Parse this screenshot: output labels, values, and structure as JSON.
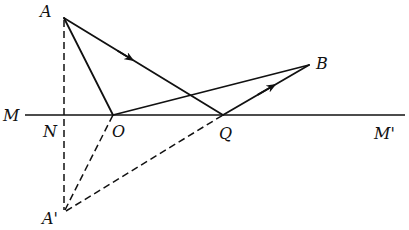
{
  "diagram": {
    "labels": {
      "A": "A",
      "A_prime": "A'",
      "B": "B",
      "M": "M",
      "M_prime": "M'",
      "N": "N",
      "O": "O",
      "Q": "Q"
    },
    "points": {
      "A": [
        64,
        18
      ],
      "N": [
        64,
        115
      ],
      "A_prime": [
        64,
        212
      ],
      "O": [
        113,
        115
      ],
      "Q": [
        223,
        115
      ],
      "B": [
        309,
        65
      ]
    },
    "line_MM_prime": {
      "x1": 25,
      "x2": 405,
      "y": 115
    },
    "segments_solid": [
      "A-O",
      "O-B",
      "A-Q",
      "Q-B"
    ],
    "segments_dashed": [
      "A-A'",
      "A'-O",
      "A'-Q"
    ],
    "arrows": [
      "on A-Q toward Q",
      "on Q-B toward B"
    ],
    "colors": {
      "ink": "#111111",
      "background": "#ffffff"
    }
  }
}
